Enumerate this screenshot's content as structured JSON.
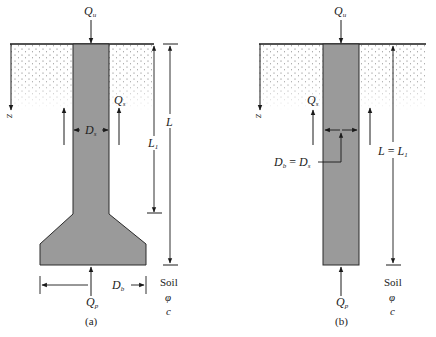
{
  "colors": {
    "pile_fill": "#9a9a9a",
    "pile_stroke": "#2a2a2a",
    "soil_dots": "#555555",
    "line": "#1a1a1a",
    "background": "#ffffff"
  },
  "figure_a": {
    "caption": "(a)",
    "type": "belled pile",
    "top_load": {
      "main": "Q",
      "sub": "u"
    },
    "skin_load": {
      "main": "Q",
      "sub": "s"
    },
    "point_load": {
      "main": "Q",
      "sub": "p"
    },
    "shaft_diameter": {
      "main": "D",
      "sub": "s"
    },
    "base_diameter": {
      "main": "D",
      "sub": "b"
    },
    "depth_axis": "z",
    "shaft_length": {
      "main": "L",
      "sub": "1"
    },
    "total_length": {
      "main": "L",
      "sub": ""
    },
    "soil": {
      "title": "Soil",
      "phi": "φ",
      "c": "c"
    }
  },
  "figure_b": {
    "caption": "(b)",
    "type": "straight shaft pile",
    "top_load": {
      "main": "Q",
      "sub": "u"
    },
    "skin_load": {
      "main": "Q",
      "sub": "s"
    },
    "point_load": {
      "main": "Q",
      "sub": "p"
    },
    "diameter_equation": {
      "lhs": "D",
      "lhs_sub": "b",
      "eq": " = ",
      "rhs": "D",
      "rhs_sub": "s"
    },
    "depth_axis": "z",
    "length_equation": {
      "lhs": "L",
      "eq": " = ",
      "rhs": "L",
      "rhs_sub": "1"
    },
    "soil": {
      "title": "Soil",
      "phi": "φ",
      "c": "c"
    }
  }
}
